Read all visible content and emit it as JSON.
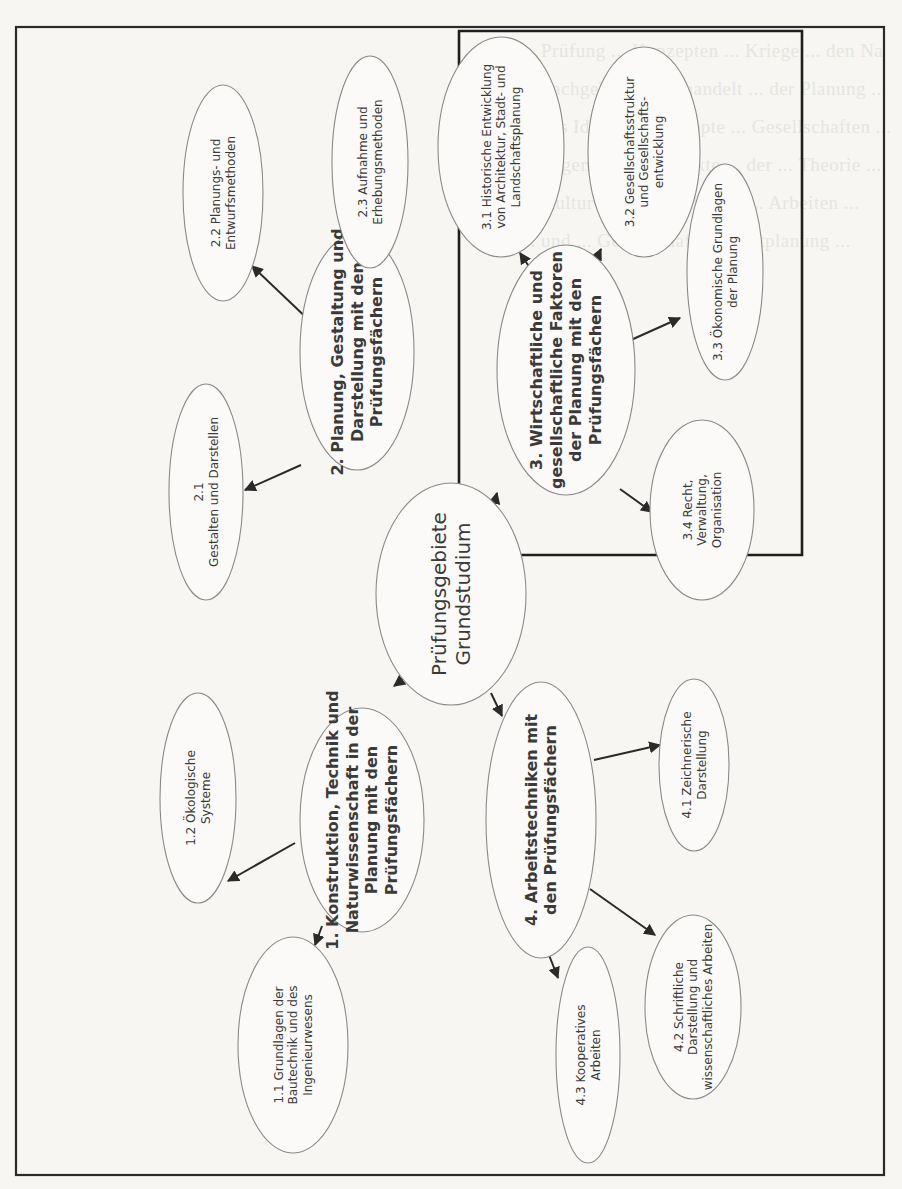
{
  "diagram": {
    "orientation": "rotated -90deg",
    "background_text_lines": [
      "... Prüfung ... Konzepten ... Kriege ... den Na",
      "... Fachgebiete ... behandelt ... der Planung ...",
      "... das Ideale ... Konzepte ... Gesellschaften ...",
      "... allgemeine ... Aspekte ... der ... Theorie ...",
      "... Kultur ... Prüfungsfächer ... Arbeiten ...",
      "... und ... Gesellschaft ... Stadtplanung ..."
    ],
    "nodes": [
      {
        "id": "root",
        "cx": 451,
        "cy": 594,
        "rx": 75,
        "ry": 111,
        "bold": false,
        "size": 20,
        "lines": [
          "Prüfungsgebiete",
          "Grundstudium"
        ]
      },
      {
        "id": "n1",
        "cx": 362,
        "cy": 820,
        "rx": 62,
        "ry": 112,
        "bold": true,
        "size": 16,
        "lines": [
          "1. Konstruktion, Technik und",
          "Naturwissenschaft in der",
          "Planung mit den",
          "Prüfungsfächern"
        ]
      },
      {
        "id": "n1_1",
        "cx": 293,
        "cy": 1045,
        "rx": 55,
        "ry": 108,
        "bold": false,
        "size": 12,
        "lines": [
          "1.1 Grundlagen der",
          "Bautechnik und des",
          "Ingenieurwesens"
        ]
      },
      {
        "id": "n1_2",
        "cx": 198,
        "cy": 798,
        "rx": 38,
        "ry": 105,
        "bold": false,
        "size": 12,
        "lines": [
          "1.2 Ökologische",
          "Systeme"
        ]
      },
      {
        "id": "n2",
        "cx": 357,
        "cy": 352,
        "rx": 57,
        "ry": 118,
        "bold": true,
        "size": 16,
        "lines": [
          "2. Planung, Gestaltung und",
          "Darstellung mit den",
          "Prüfungsfächern"
        ]
      },
      {
        "id": "n2_1",
        "cx": 206,
        "cy": 492,
        "rx": 37,
        "ry": 108,
        "bold": false,
        "size": 12,
        "lines": [
          "2.1",
          "Gestalten und Darstellen"
        ]
      },
      {
        "id": "n2_2",
        "cx": 223,
        "cy": 193,
        "rx": 40,
        "ry": 108,
        "bold": false,
        "size": 12,
        "lines": [
          "2.2 Planungs- und",
          "Entwurfsmethoden"
        ]
      },
      {
        "id": "n2_3",
        "cx": 370,
        "cy": 162,
        "rx": 38,
        "ry": 106,
        "bold": false,
        "size": 12,
        "lines": [
          "2.3 Aufnahme und",
          "Erhebungsmethoden"
        ]
      },
      {
        "id": "n3",
        "cx": 566,
        "cy": 370,
        "rx": 69,
        "ry": 125,
        "bold": true,
        "size": 16,
        "lines": [
          "3. Wirtschaftliche und",
          "gesellschaftliche Faktoren",
          "der Planung mit den",
          "Prüfungsfächern"
        ]
      },
      {
        "id": "n3_1",
        "cx": 501,
        "cy": 147,
        "rx": 63,
        "ry": 110,
        "bold": false,
        "size": 12,
        "lines": [
          "3.1 Historische Entwicklung",
          "von Architektur, Stadt- und",
          "Landschaftsplanung"
        ]
      },
      {
        "id": "n3_2",
        "cx": 644,
        "cy": 152,
        "rx": 56,
        "ry": 105,
        "bold": false,
        "size": 12,
        "lines": [
          "3.2 Gesellschaftsstruktur",
          "und Gesellschafts-",
          "entwicklung"
        ]
      },
      {
        "id": "n3_3",
        "cx": 725,
        "cy": 272,
        "rx": 38,
        "ry": 108,
        "bold": false,
        "size": 12,
        "lines": [
          "3.3 Ökonomische Grundlagen",
          "der Planung"
        ]
      },
      {
        "id": "n3_4",
        "cx": 702,
        "cy": 510,
        "rx": 52,
        "ry": 90,
        "bold": false,
        "size": 12,
        "lines": [
          "3.4 Recht,",
          "Verwaltung,",
          "Organisation"
        ]
      },
      {
        "id": "n4",
        "cx": 541,
        "cy": 820,
        "rx": 55,
        "ry": 138,
        "bold": true,
        "size": 16,
        "lines": [
          "4. Arbeitstechniken mit",
          "den Prüfungsfächern"
        ]
      },
      {
        "id": "n4_1",
        "cx": 694,
        "cy": 765,
        "rx": 35,
        "ry": 86,
        "bold": false,
        "size": 12,
        "lines": [
          "4.1 Zeichnerische",
          "Darstellung"
        ]
      },
      {
        "id": "n4_2",
        "cx": 693,
        "cy": 1007,
        "rx": 48,
        "ry": 92,
        "bold": false,
        "size": 12,
        "lines": [
          "4.2 Schriftliche",
          "Darstellung und",
          "wissenschaftliches Arbeiten"
        ]
      },
      {
        "id": "n4_3",
        "cx": 588,
        "cy": 1055,
        "rx": 32,
        "ry": 108,
        "bold": false,
        "size": 12,
        "lines": [
          "4.3 Kooperatives",
          "Arbeiten"
        ]
      }
    ],
    "edges": [
      {
        "from": "root",
        "to": "n1",
        "x1": 413,
        "y1": 672,
        "x2": 394,
        "y2": 686
      },
      {
        "from": "root",
        "to": "n2",
        "x1": 411,
        "y1": 551,
        "x2": 389,
        "y2": 533
      },
      {
        "from": "root",
        "to": "n3",
        "x1": 493,
        "y1": 509,
        "x2": 497,
        "y2": 493
      },
      {
        "from": "root",
        "to": "n4",
        "x1": 491,
        "y1": 693,
        "x2": 502,
        "y2": 716
      },
      {
        "from": "n1",
        "to": "n1_1",
        "x1": 322,
        "y1": 926,
        "x2": 315,
        "y2": 945
      },
      {
        "from": "n1",
        "to": "n1_2",
        "x1": 295,
        "y1": 843,
        "x2": 228,
        "y2": 881
      },
      {
        "from": "n2",
        "to": "n2_1",
        "x1": 301,
        "y1": 465,
        "x2": 245,
        "y2": 490
      },
      {
        "from": "n2",
        "to": "n2_2",
        "x1": 313,
        "y1": 324,
        "x2": 252,
        "y2": 266
      },
      {
        "from": "n2",
        "to": "n2_3",
        "x1": 374,
        "y1": 279,
        "x2": 378,
        "y2": 258
      },
      {
        "from": "n3",
        "to": "n3_1",
        "x1": 530,
        "y1": 268,
        "x2": 520,
        "y2": 253
      },
      {
        "from": "n3",
        "to": "n3_2",
        "x1": 591,
        "y1": 270,
        "x2": 601,
        "y2": 249
      },
      {
        "from": "n3",
        "to": "n3_3",
        "x1": 622,
        "y1": 344,
        "x2": 680,
        "y2": 318
      },
      {
        "from": "n3",
        "to": "n3_4",
        "x1": 620,
        "y1": 489,
        "x2": 652,
        "y2": 512
      },
      {
        "from": "n4",
        "to": "n4_1",
        "x1": 594,
        "y1": 760,
        "x2": 660,
        "y2": 745
      },
      {
        "from": "n4",
        "to": "n4_2",
        "x1": 590,
        "y1": 889,
        "x2": 655,
        "y2": 935
      },
      {
        "from": "n4",
        "to": "n4_3",
        "x1": 549,
        "y1": 955,
        "x2": 558,
        "y2": 978
      }
    ],
    "frames": {
      "outer": {
        "x": 16,
        "y": 26,
        "w": 868,
        "h": 1150
      },
      "highlight_box": {
        "x": 459,
        "y": 31,
        "w": 343,
        "h": 247,
        "note": "box drawn around section 3 and central node top"
      }
    }
  }
}
